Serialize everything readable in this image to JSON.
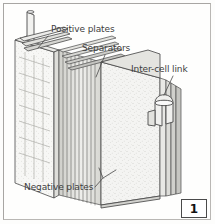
{
  "figure": {
    "number": "1",
    "background_color": "#fdfdfc",
    "border_color": "#b9b7b4",
    "label_color": "#3d3d3d",
    "line_color": "#4a4a4a"
  },
  "labels": {
    "positive_plates": "Positive plates",
    "separators": "Separators",
    "inter_cell_link": "Inter-cell link",
    "negative_plates": "Negative plates"
  },
  "parts": [
    {
      "name": "terminal-post",
      "label": ""
    },
    {
      "name": "positive-plate-grid",
      "label": "Positive plates"
    },
    {
      "name": "separator-stack",
      "label": "Separators"
    },
    {
      "name": "inter-cell-link-hook",
      "label": "Inter-cell link"
    },
    {
      "name": "negative-plate-face",
      "label": "Negative plates"
    }
  ]
}
